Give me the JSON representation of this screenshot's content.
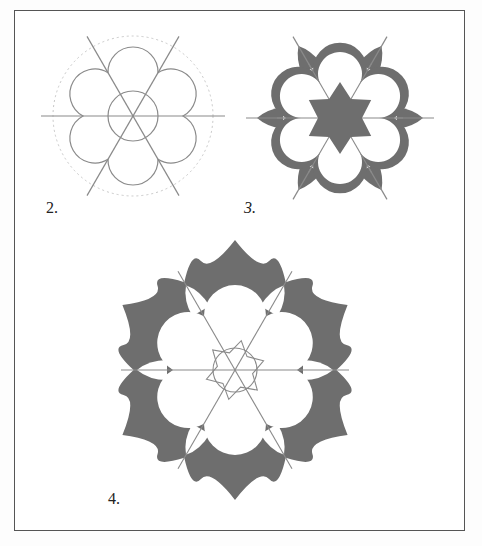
{
  "page": {
    "frame": {
      "left": 14,
      "top": 10,
      "width": 451,
      "height": 521
    },
    "colors": {
      "fill": "#6e6e6e",
      "line": "#8a8a8a",
      "dashed": "#c8c8c8",
      "frame": "#555555",
      "background": "#ffffff"
    }
  },
  "figures": [
    {
      "id": "fig2",
      "label": "2.",
      "label_pos": {
        "x": 46,
        "y": 199
      },
      "center": {
        "x": 133,
        "y": 116
      },
      "petal_dist": 44,
      "petal_r": 25,
      "center_circle_r": 25,
      "axis_len": 92,
      "guide_r": 80
    },
    {
      "id": "fig3",
      "label": "3.",
      "label_pos": {
        "x": 244,
        "y": 199
      },
      "center": {
        "x": 340,
        "y": 118
      },
      "petal_dist": 45,
      "petal_r": 25,
      "axis_len": 94,
      "star_r_outer": 36,
      "star_r_inner": 22
    },
    {
      "id": "fig4",
      "label": "4.",
      "label_pos": {
        "x": 108,
        "y": 490
      },
      "center": {
        "x": 235,
        "y": 370
      },
      "outer_r": 130,
      "petal_dist": 54,
      "petal_r": 31,
      "axis_len": 114,
      "center_circle_r": 22
    }
  ]
}
